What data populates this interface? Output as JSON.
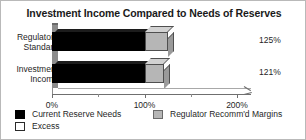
{
  "chart_data": {
    "type": "bar",
    "orientation": "horizontal",
    "style": "3d-stacked",
    "title": "Investment Income Compared to Needs of Reserves",
    "xlabel": "",
    "ylabel": "",
    "categories": [
      "Regulatory Standard",
      "Investment Income"
    ],
    "category_lines": [
      [
        "Regulatory",
        "Standard"
      ],
      [
        "Investment",
        "Income"
      ]
    ],
    "xlim": [
      0,
      200
    ],
    "xtick_values": [
      0,
      50,
      100,
      150,
      200
    ],
    "xtick_labels": [
      "0%",
      "",
      "100%",
      "",
      "200%"
    ],
    "xtick_major": [
      0,
      100,
      200
    ],
    "xtick_minor": [
      50,
      150
    ],
    "grid": false,
    "legend_position": "bottom",
    "series": [
      {
        "name": "Current Reserve Needs",
        "color": "#000000",
        "values": [
          100,
          100
        ]
      },
      {
        "name": "Regulator Recomm'd Margins",
        "color": "#b6b6b6",
        "values": [
          25,
          21
        ]
      },
      {
        "name": "Excess",
        "color": "#ffffff",
        "values": [
          0,
          0
        ]
      }
    ],
    "totals": [
      125,
      121
    ],
    "data_labels": [
      "125%",
      "121%"
    ],
    "annotations": []
  },
  "title": {
    "text": "Investment Income Compared to Needs of Reserves"
  },
  "axis": {
    "ticks": [
      {
        "label": "0%",
        "value": 0
      },
      {
        "label": "100%",
        "value": 100
      },
      {
        "label": "200%",
        "value": 200
      }
    ]
  },
  "bars": [
    {
      "category_line1": "Regulatory",
      "category_line2": "Standard",
      "value_label": "125%"
    },
    {
      "category_line1": "Investment",
      "category_line2": "Income",
      "value_label": "121%"
    }
  ],
  "legend": {
    "left": [
      {
        "label": "Current Reserve Needs",
        "swatch": "black-swatch-icon"
      },
      {
        "label": "Excess",
        "swatch": "white-swatch-icon"
      }
    ],
    "right": [
      {
        "label": "Regulator Recomm'd Margins",
        "swatch": "grey-swatch-icon"
      }
    ]
  },
  "colors": {
    "current_reserve_needs": "#000000",
    "excess": "#ffffff",
    "regulator_margins": "#b6b6b6",
    "axis": "#6f6f6f",
    "wall": "#8c8c8c",
    "text": "#1f1f1f",
    "frame": "#b9b9b9"
  }
}
